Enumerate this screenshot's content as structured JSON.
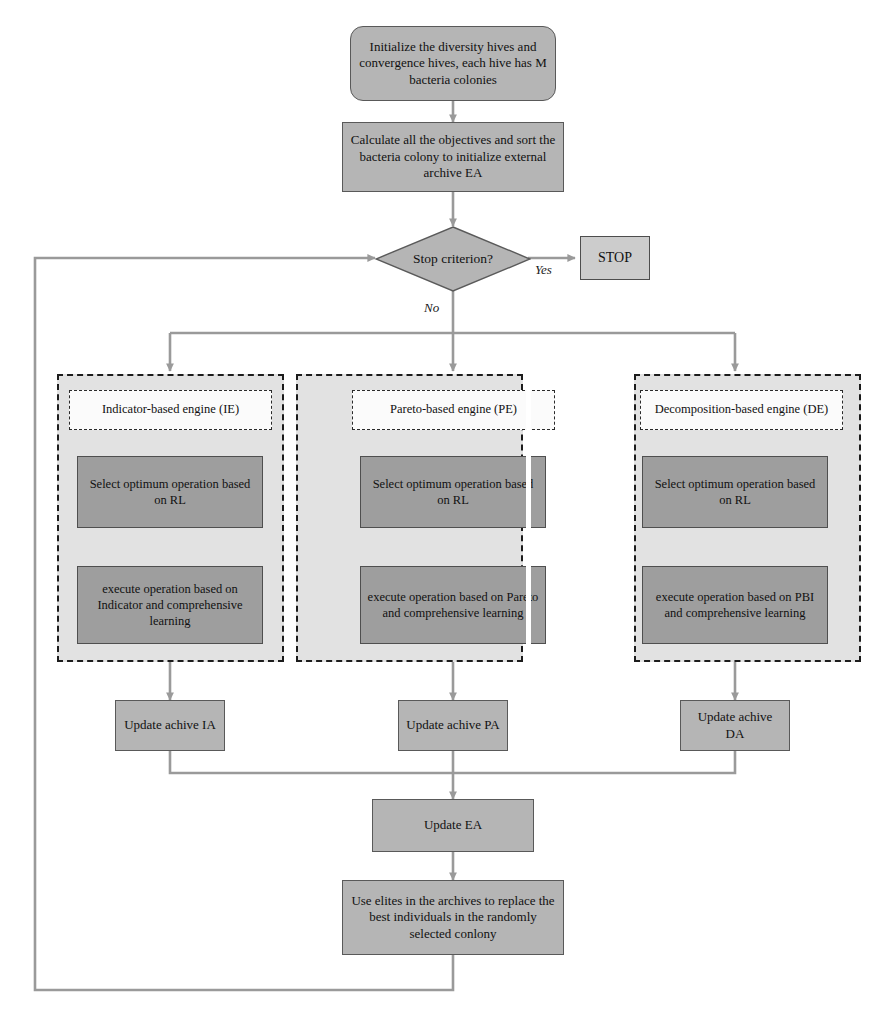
{
  "diagram": {
    "type": "flowchart",
    "colors": {
      "process_fill": "#b5b5b5",
      "inner_process_fill": "#9e9e9e",
      "panel_fill": "#e2e2e2",
      "panel_title_fill": "#fbfbfb",
      "stop_fill": "#cccccc",
      "border": "#595959",
      "connector": "#9a9a9a",
      "panel_border": "#1c1c1c",
      "text": "#111111"
    }
  },
  "nodes": {
    "initialize": "Initialize the diversity hives and convergence hives, each hive has M bacteria colonies",
    "calculate": "Calculate all the objectives and sort the bacteria colony to initialize external archive EA",
    "decision": "Stop criterion?",
    "stop": "STOP",
    "update_ea": "Update EA",
    "use_elites": "Use elites in the archives to replace the best individuals in the randomly selected conlony"
  },
  "edge_labels": {
    "yes": "Yes",
    "no": "No"
  },
  "engines": [
    {
      "id": "indicator",
      "title": "Indicator-based engine (IE)",
      "select_step": "Select optimum operation based on RL",
      "execute_step": "execute operation based on Indicator and comprehensive learning",
      "archive": "Update achive IA"
    },
    {
      "id": "pareto",
      "title": "Pareto-based engine (PE)",
      "select_step": "Select optimum operation based on RL",
      "execute_step": "execute operation based on Pareto and comprehensive learning",
      "archive": "Update achive PA"
    },
    {
      "id": "decomposition",
      "title": "Decomposition-based engine (DE)",
      "select_step": "Select optimum operation based on RL",
      "execute_step": "execute operation based on PBI and comprehensive learning",
      "archive": "Update achive DA"
    }
  ]
}
